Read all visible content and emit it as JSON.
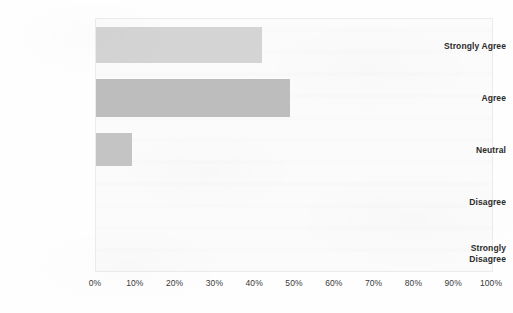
{
  "chart_data": {
    "type": "bar",
    "orientation": "horizontal",
    "title": "",
    "subtitle": "",
    "xlabel": "",
    "ylabel": "",
    "categories": [
      "Strongly Agree",
      "Agree",
      "Neutral",
      "Disagree",
      "Strongly Disagree"
    ],
    "values": [
      42,
      49,
      9,
      0,
      0
    ],
    "value_unit": "%",
    "xlim": [
      0,
      100
    ],
    "x_tick_labels": [
      "0%",
      "10%",
      "20%",
      "30%",
      "40%",
      "50%",
      "60%",
      "70%",
      "80%",
      "90%",
      "100%"
    ],
    "x_tick_values": [
      0,
      10,
      20,
      30,
      40,
      50,
      60,
      70,
      80,
      90,
      100
    ],
    "grid": false,
    "legend": false,
    "legend_position": "none",
    "series": [
      {
        "name": "Responses",
        "values": [
          42,
          49,
          9,
          0,
          0
        ]
      }
    ],
    "bar_colors": [
      "#d4d4d4",
      "#bdbdbd",
      "#c4c4c4",
      "#c4c4c4",
      "#c4c4c4"
    ],
    "plot_background": "#fbfbfb",
    "axis_color": "#ececec",
    "label_color": "#2b2b2b"
  },
  "axis": {
    "y_labels": [
      {
        "line1": "Strongly Agree",
        "line2": ""
      },
      {
        "line1": "Agree",
        "line2": ""
      },
      {
        "line1": "Neutral",
        "line2": ""
      },
      {
        "line1": "Disagree",
        "line2": ""
      },
      {
        "line1": "Strongly",
        "line2": "Disagree"
      }
    ]
  }
}
